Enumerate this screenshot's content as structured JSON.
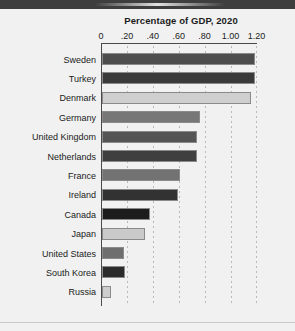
{
  "chart_data": {
    "type": "bar",
    "orientation": "horizontal",
    "title": "Percentage of GDP, 2020",
    "xlabel": "",
    "ylabel": "",
    "xlim": [
      0,
      1.2
    ],
    "grid": true,
    "legend": "none",
    "tick_labels": [
      "0",
      ".20",
      ".40",
      ".60",
      ".80",
      "1.00",
      "1.20"
    ],
    "tick_values": [
      0,
      0.2,
      0.4,
      0.6,
      0.8,
      1.0,
      1.2
    ],
    "categories": [
      "Sweden",
      "Turkey",
      "Denmark",
      "Germany",
      "United Kingdom",
      "Netherlands",
      "France",
      "Ireland",
      "Canada",
      "Japan",
      "United States",
      "South Korea",
      "Russia"
    ],
    "values": [
      1.18,
      1.18,
      1.15,
      0.76,
      0.73,
      0.73,
      0.6,
      0.59,
      0.37,
      0.33,
      0.17,
      0.18,
      0.07
    ],
    "bar_colors": [
      "#4d4d4d",
      "#3a3a3a",
      "#cfcfcf",
      "#777777",
      "#555555",
      "#3f3f3f",
      "#727272",
      "#323232",
      "#1c1c1c",
      "#cacaca",
      "#6e6e6e",
      "#2b2b2b",
      "#cdcdcd"
    ]
  },
  "style": {
    "background": "#f1f1f1",
    "top_band": "#3e3e3e",
    "axis_color": "#4a4a4a",
    "text_color": "#1b1b1b"
  }
}
